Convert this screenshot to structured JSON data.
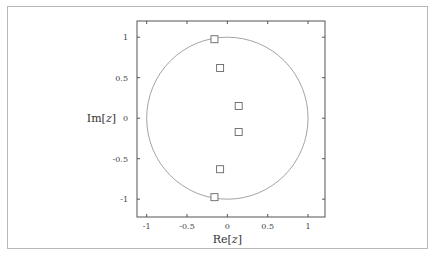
{
  "chart_data": {
    "type": "scatter",
    "title": "",
    "xlabel": "Re[z]",
    "ylabel": "Im[z]",
    "xlim": [
      -1.12,
      1.21
    ],
    "ylim": [
      -1.22,
      1.2
    ],
    "xticks": [
      -1,
      -0.5,
      0,
      0.5,
      1
    ],
    "yticks": [
      1,
      0.5,
      0,
      -0.5,
      -1
    ],
    "xtick_labels": [
      "-1",
      "-0.5",
      "0",
      "0.5",
      "1"
    ],
    "ytick_labels": [
      "1",
      "0.5",
      "0",
      "-0.5",
      "-1"
    ],
    "grid": false,
    "legend": null,
    "annotations": [
      {
        "type": "circle",
        "center": [
          0,
          0
        ],
        "radius": 1,
        "label": "unit circle"
      }
    ],
    "series": [
      {
        "name": "points",
        "marker": "square-open",
        "x": [
          -0.16,
          -0.09,
          0.14,
          0.14,
          -0.09,
          -0.16
        ],
        "y": [
          0.975,
          0.62,
          0.15,
          -0.17,
          -0.63,
          -0.975
        ]
      }
    ]
  },
  "colors": {
    "axis": "#555555",
    "circle": "#999999",
    "marker": "#666666",
    "frame": "#b8b8b8"
  }
}
